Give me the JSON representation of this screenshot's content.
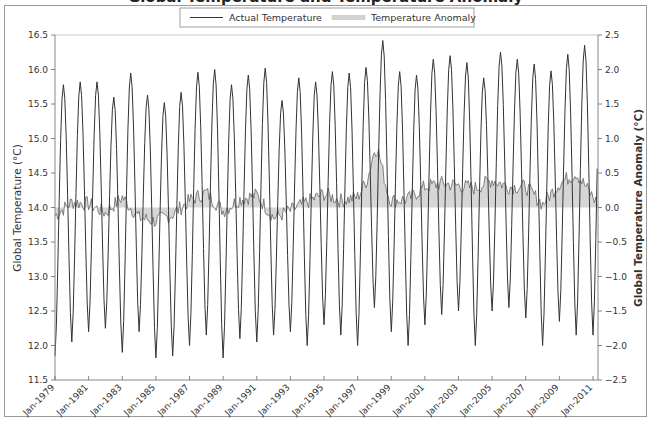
{
  "title": "Global Temperature and Temperature Anomaly",
  "legend": {
    "items": [
      {
        "label": "Actual Temperature",
        "style": "line",
        "color": "#333333"
      },
      {
        "label": "Temperature Anomaly",
        "style": "fill",
        "color": "#cccccc"
      }
    ]
  },
  "axes": {
    "left": {
      "label": "Global Temperature (°C)",
      "ticks": [
        "11.5",
        "12.0",
        "12.5",
        "13.0",
        "13.5",
        "14.0",
        "14.5",
        "15.0",
        "15.5",
        "16.0",
        "16.5"
      ],
      "min": 11.5,
      "max": 16.5
    },
    "right": {
      "label": "Global Temperature Anomaly (°C)",
      "ticks": [
        "-2.5",
        "-2.0",
        "-1.5",
        "-1.0",
        "-0.5",
        "0.0",
        "0.5",
        "1.0",
        "1.5",
        "2.0",
        "2.5"
      ],
      "min": -2.5,
      "max": 2.5
    },
    "x": {
      "ticks": [
        "Jan-1979",
        "Jan-1981",
        "Jan-1983",
        "Jan-1985",
        "Jan-1987",
        "Jan-1989",
        "Jan-1991",
        "Jan-1993",
        "Jan-1995",
        "Jan-1997",
        "Jan-1999",
        "Jan-2001",
        "Jan-2003",
        "Jan-2005",
        "Jan-2007",
        "Jan-2009",
        "Jan-2011"
      ]
    }
  },
  "chart_data": {
    "type": "line",
    "title": "Global Temperature and Temperature Anomaly",
    "xlabel": "",
    "ylabel": "Global Temperature (°C)",
    "y2label": "Global Temperature Anomaly (°C)",
    "ylim": [
      11.5,
      16.5
    ],
    "y2lim": [
      -2.5,
      2.5
    ],
    "x_range": [
      "Jan-1979",
      "Mar-2011"
    ],
    "grid": false,
    "legend_position": "top center",
    "x_ticks": [
      "Jan-1979",
      "Jan-1981",
      "Jan-1983",
      "Jan-1985",
      "Jan-1987",
      "Jan-1989",
      "Jan-1991",
      "Jan-1993",
      "Jan-1995",
      "Jan-1997",
      "Jan-1999",
      "Jan-2001",
      "Jan-2003",
      "Jan-2005",
      "Jan-2007",
      "Jan-2009",
      "Jan-2011"
    ],
    "series": [
      {
        "name": "Actual Temperature",
        "axis": "left",
        "type": "line",
        "years": [
          1979,
          1980,
          1981,
          1982,
          1983,
          1984,
          1985,
          1986,
          1987,
          1988,
          1989,
          1990,
          1991,
          1992,
          1993,
          1994,
          1995,
          1996,
          1997,
          1998,
          1999,
          2000,
          2001,
          2002,
          2003,
          2004,
          2005,
          2006,
          2007,
          2008,
          2009,
          2010
        ],
        "annual_peak_mid_year": [
          15.78,
          15.82,
          15.82,
          15.6,
          15.95,
          15.63,
          15.52,
          15.67,
          15.96,
          16.0,
          15.78,
          15.92,
          16.02,
          15.55,
          15.88,
          15.82,
          15.97,
          15.95,
          16.03,
          16.42,
          15.97,
          15.92,
          16.15,
          16.2,
          16.1,
          15.88,
          16.25,
          16.15,
          16.08,
          15.98,
          16.22,
          16.35
        ],
        "annual_trough_january": [
          11.85,
          12.05,
          12.2,
          12.25,
          11.9,
          12.2,
          11.82,
          11.85,
          12.0,
          12.15,
          11.82,
          12.1,
          12.05,
          12.15,
          12.2,
          12.0,
          12.3,
          12.15,
          12.0,
          12.55,
          12.2,
          12.0,
          12.3,
          12.45,
          12.5,
          12.0,
          12.5,
          12.55,
          12.4,
          12.0,
          12.35,
          12.15
        ]
      },
      {
        "name": "Temperature Anomaly",
        "axis": "right",
        "type": "area",
        "years": [
          1979,
          1980,
          1981,
          1982,
          1983,
          1984,
          1985,
          1986,
          1987,
          1988,
          1989,
          1990,
          1991,
          1992,
          1993,
          1994,
          1995,
          1996,
          1997,
          1998,
          1999,
          2000,
          2001,
          2002,
          2003,
          2004,
          2005,
          2006,
          2007,
          2008,
          2009,
          2010,
          2011
        ],
        "annual_mean_anomaly": [
          -0.12,
          0.08,
          0.05,
          -0.08,
          0.15,
          -0.15,
          -0.2,
          -0.1,
          0.1,
          0.22,
          -0.05,
          0.12,
          0.18,
          -0.15,
          -0.05,
          0.08,
          0.2,
          0.1,
          0.15,
          0.6,
          0.1,
          0.12,
          0.3,
          0.35,
          0.32,
          0.28,
          0.4,
          0.3,
          0.3,
          0.05,
          0.35,
          0.5,
          0.15
        ]
      }
    ]
  }
}
